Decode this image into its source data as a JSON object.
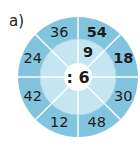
{
  "exercise": {
    "label": "a)",
    "operator": ": 6",
    "colors": {
      "outer_ring": "#82c4de",
      "inner_ring": "#c4e6f2",
      "center": "#ffffff",
      "divider": "#ffffff",
      "text": "#1c1c1c"
    },
    "outer_values": [
      {
        "value": "54",
        "bold": true
      },
      {
        "value": "18",
        "bold": true
      },
      {
        "value": "30",
        "bold": false
      },
      {
        "value": "48",
        "bold": false
      },
      {
        "value": "12",
        "bold": false
      },
      {
        "value": "42",
        "bold": false
      },
      {
        "value": "24",
        "bold": false
      },
      {
        "value": "36",
        "bold": false
      }
    ],
    "inner_values": [
      {
        "value": "9",
        "bold": true
      },
      {
        "value": "",
        "bold": false
      },
      {
        "value": "",
        "bold": false
      },
      {
        "value": "",
        "bold": false
      },
      {
        "value": "",
        "bold": false
      },
      {
        "value": "",
        "bold": false
      },
      {
        "value": "",
        "bold": false
      },
      {
        "value": "",
        "bold": false
      }
    ]
  }
}
